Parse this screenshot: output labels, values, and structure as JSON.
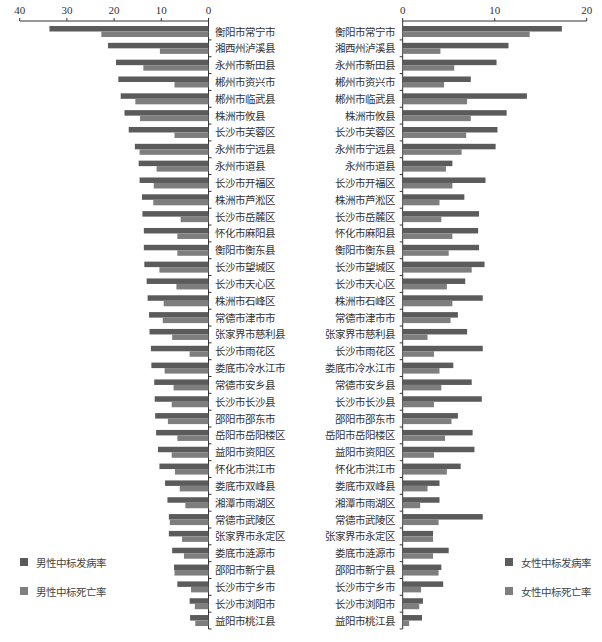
{
  "chart_data": [
    {
      "type": "bar",
      "orientation": "horizontal",
      "direction": "right-to-left",
      "title": "",
      "xlabel": "",
      "ylabel": "",
      "xlim": [
        0,
        40
      ],
      "xticks": [
        "40",
        "30",
        "20",
        "10",
        "0"
      ],
      "xtick_values": [
        40,
        30,
        20,
        10,
        0
      ],
      "grid": false,
      "legend_position": "bottom-left",
      "categories": [
        "衡阳市常宁市",
        "湘西州泸溪县",
        "永州市新田县",
        "郴州市资兴市",
        "郴州市临武县",
        "株洲市攸县",
        "长沙市芙蓉区",
        "永州市宁远县",
        "永州市道县",
        "长沙市开福区",
        "株洲市芦淞区",
        "长沙市岳麓区",
        "怀化市麻阳县",
        "衡阳市衡东县",
        "长沙市望城区",
        "长沙市天心区",
        "株洲市石峰区",
        "常德市津市市",
        "张家界市慈利县",
        "长沙市雨花区",
        "娄底市冷水江市",
        "常德市安乡县",
        "长沙市长沙县",
        "邵阳市邵东市",
        "岳阳市岳阳楼区",
        "益阳市资阳区",
        "怀化市洪江市",
        "娄底市双峰县",
        "湘潭市雨湖区",
        "常德市武陵区",
        "张家界市永定区",
        "娄底市涟源市",
        "邵阳市新宁县",
        "长沙市宁乡市",
        "长沙市浏阳市",
        "益阳市桃江县"
      ],
      "series": [
        {
          "name": "男性中标发病率",
          "color": "#5b5b5b",
          "values": [
            33.7,
            21.3,
            19.6,
            19.1,
            18.6,
            17.8,
            16.9,
            15.6,
            14.8,
            14.6,
            14.1,
            14.0,
            13.7,
            13.7,
            13.6,
            13.1,
            12.9,
            12.6,
            12.5,
            12.2,
            12.1,
            11.5,
            11.4,
            11.3,
            11.1,
            10.7,
            10.4,
            9.2,
            8.7,
            8.4,
            8.4,
            7.7,
            7.3,
            6.6,
            4.0,
            3.9
          ]
        },
        {
          "name": "男性中标死亡率",
          "color": "#7e7e7e",
          "values": [
            22.7,
            10.3,
            13.8,
            7.2,
            15.5,
            14.5,
            7.2,
            14.6,
            11.0,
            11.6,
            11.7,
            5.9,
            6.6,
            6.6,
            10.4,
            6.8,
            9.5,
            9.7,
            7.7,
            4.0,
            9.3,
            7.4,
            7.8,
            8.6,
            6.6,
            7.8,
            7.1,
            6.1,
            4.9,
            8.2,
            5.6,
            5.2,
            7.2,
            3.7,
            2.9,
            2.8
          ]
        }
      ]
    },
    {
      "type": "bar",
      "orientation": "horizontal",
      "direction": "left-to-right",
      "title": "",
      "xlabel": "",
      "ylabel": "",
      "xlim": [
        0,
        20
      ],
      "xticks": [
        "0",
        "10",
        "20"
      ],
      "xtick_values": [
        0,
        10,
        20
      ],
      "grid": false,
      "legend_position": "bottom-right",
      "categories": [
        "衡阳市常宁市",
        "湘西州泸溪县",
        "永州市新田县",
        "郴州市资兴市",
        "郴州市临武县",
        "株洲市攸县",
        "长沙市芙蓉区",
        "永州市宁远县",
        "永州市道县",
        "长沙市开福区",
        "株洲市芦淞区",
        "长沙市岳麓区",
        "怀化市麻阳县",
        "衡阳市衡东县",
        "长沙市望城区",
        "长沙市天心区",
        "株洲市石峰区",
        "常德市津市市",
        "张家界市慈利县",
        "长沙市雨花区",
        "娄底市冷水江市",
        "常德市安乡县",
        "长沙市长沙县",
        "邵阳市邵东市",
        "岳阳市岳阳楼区",
        "益阳市资阳区",
        "怀化市洪江市",
        "娄底市双峰县",
        "湘潭市雨湖区",
        "常德市武陵区",
        "张家界市永定区",
        "娄底市涟源市",
        "邵阳市新宁县",
        "长沙市宁乡市",
        "长沙市浏阳市",
        "益阳市桃江县"
      ],
      "series": [
        {
          "name": "女性中标发病率",
          "color": "#5b5b5b",
          "values": [
            17.3,
            11.5,
            10.2,
            7.4,
            13.5,
            11.3,
            10.3,
            10.1,
            5.4,
            9.0,
            6.7,
            8.3,
            8.2,
            8.3,
            8.9,
            6.8,
            8.7,
            6.0,
            7.0,
            8.7,
            5.5,
            7.5,
            8.6,
            6.0,
            7.6,
            7.8,
            6.3,
            4.0,
            4.0,
            8.7,
            3.3,
            5.0,
            4.2,
            4.4,
            2.2,
            2.1
          ]
        },
        {
          "name": "女性中标死亡率",
          "color": "#7e7e7e",
          "values": [
            13.8,
            4.1,
            5.6,
            4.5,
            7.0,
            7.4,
            6.9,
            6.4,
            4.7,
            5.4,
            4.0,
            4.2,
            5.4,
            5.0,
            7.5,
            4.8,
            5.4,
            5.2,
            2.7,
            3.4,
            4.0,
            4.2,
            3.4,
            5.3,
            4.6,
            3.4,
            4.8,
            2.7,
            1.9,
            3.9,
            3.3,
            3.3,
            3.9,
            2.0,
            1.8,
            0.7
          ]
        }
      ]
    }
  ],
  "legends": {
    "left": [
      {
        "label": "男性中标发病率",
        "color": "#5b5b5b"
      },
      {
        "label": "男性中标死亡率",
        "color": "#7e7e7e"
      }
    ],
    "right": [
      {
        "label": "女性中标发病率",
        "color": "#5b5b5b"
      },
      {
        "label": "女性中标死亡率",
        "color": "#7e7e7e"
      }
    ]
  }
}
